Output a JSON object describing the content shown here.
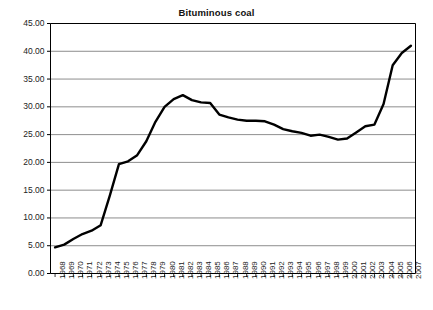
{
  "chart_data": {
    "type": "line",
    "title": "Bituminous coal",
    "xlabel": "",
    "ylabel": "",
    "ylim": [
      0,
      45
    ],
    "ytick_step": 5,
    "ytick_labels": [
      "0.00",
      "5.00",
      "10.00",
      "15.00",
      "20.00",
      "25.00",
      "30.00",
      "35.00",
      "40.00",
      "45.00"
    ],
    "grid": "horizontal",
    "legend": "none",
    "line_color": "#000000",
    "gridline_color": "#808080",
    "axis_color": "#000000",
    "categories": [
      "1968",
      "1969",
      "1970",
      "1971",
      "1972",
      "1973",
      "1974",
      "1975",
      "1976",
      "1977",
      "1978",
      "1979",
      "1980",
      "1981",
      "1982",
      "1983",
      "1984",
      "1985",
      "1986",
      "1987",
      "1988",
      "1989",
      "1990",
      "1991",
      "1992",
      "1993",
      "1994",
      "1995",
      "1996",
      "1997",
      "1998",
      "1999",
      "2000",
      "2001",
      "2002",
      "2003",
      "2004",
      "2005",
      "2006",
      "2007"
    ],
    "values": [
      4.7,
      5.2,
      6.2,
      7.1,
      7.7,
      8.7,
      14.0,
      19.7,
      20.2,
      21.3,
      23.8,
      27.3,
      30.0,
      31.4,
      32.1,
      31.2,
      30.8,
      30.7,
      28.6,
      28.1,
      27.7,
      27.5,
      27.5,
      27.4,
      26.8,
      26.0,
      25.6,
      25.3,
      24.8,
      25.0,
      24.6,
      24.1,
      24.3,
      25.4,
      26.5,
      26.8,
      30.5,
      37.5,
      39.7,
      41.0
    ]
  }
}
